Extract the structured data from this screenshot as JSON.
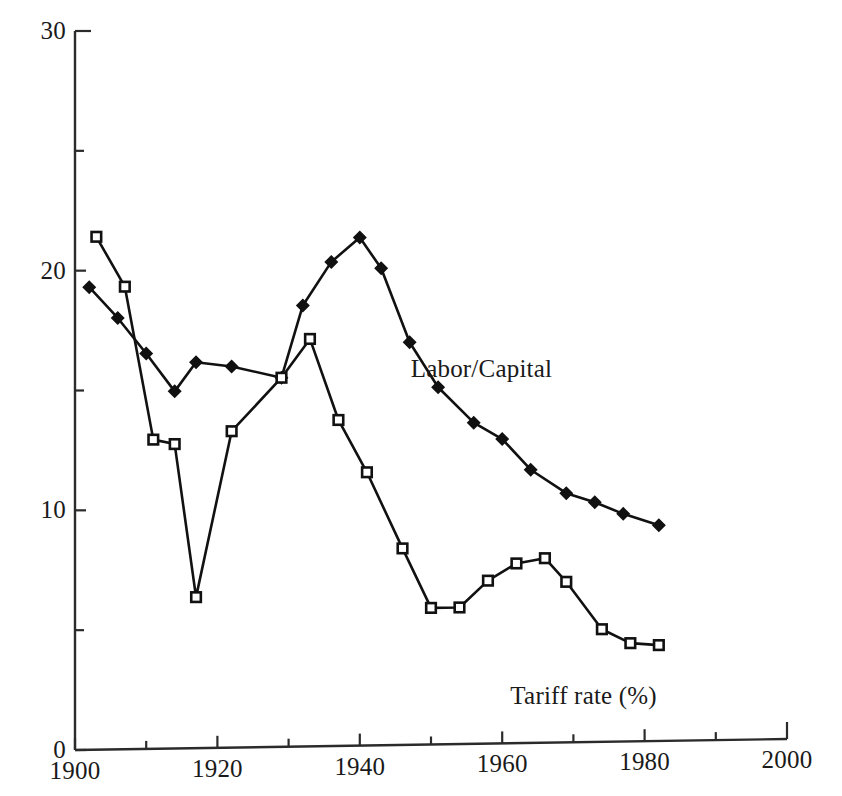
{
  "chart_data": {
    "type": "line",
    "title": "",
    "xlabel": "",
    "ylabel": "",
    "xlim": [
      1900,
      2000
    ],
    "ylim": [
      0,
      30
    ],
    "grid": false,
    "legend_position": "inline-annotation",
    "x_ticks": [
      1900,
      1920,
      1940,
      1960,
      1980,
      2000
    ],
    "x_minor_ticks": [
      1910,
      1930,
      1950,
      1970,
      1990
    ],
    "y_ticks": [
      0,
      10,
      20,
      30
    ],
    "y_minor_ticks": [
      5,
      15,
      25
    ],
    "x_tick_labels": [
      "1900",
      "1920",
      "1940",
      "1960",
      "1980",
      "2000"
    ],
    "y_tick_labels": [
      "0",
      "10",
      "20",
      "30"
    ],
    "annotations": [
      {
        "text": "Labor/Capital",
        "x": 1964,
        "y": 15.6
      },
      {
        "text": "Tariff rate (%)",
        "x": 1978,
        "y": 1.9
      }
    ],
    "series": [
      {
        "name": "Labor/Capital",
        "marker": "filled-diamond",
        "points": [
          {
            "x": 1902,
            "y": 19.3
          },
          {
            "x": 1906,
            "y": 18.0
          },
          {
            "x": 1910,
            "y": 16.5
          },
          {
            "x": 1914,
            "y": 14.9
          },
          {
            "x": 1917,
            "y": 16.1
          },
          {
            "x": 1922,
            "y": 15.9
          },
          {
            "x": 1929,
            "y": 15.4
          },
          {
            "x": 1932,
            "y": 18.4
          },
          {
            "x": 1936,
            "y": 20.2
          },
          {
            "x": 1940,
            "y": 21.2
          },
          {
            "x": 1943,
            "y": 19.9
          },
          {
            "x": 1947,
            "y": 16.8
          },
          {
            "x": 1951,
            "y": 14.9
          },
          {
            "x": 1956,
            "y": 13.4
          },
          {
            "x": 1960,
            "y": 12.7
          },
          {
            "x": 1964,
            "y": 11.4
          },
          {
            "x": 1969,
            "y": 10.4
          },
          {
            "x": 1973,
            "y": 10.0
          },
          {
            "x": 1977,
            "y": 9.5
          },
          {
            "x": 1982,
            "y": 9.0
          }
        ]
      },
      {
        "name": "Tariff rate (%)",
        "marker": "open-square",
        "points": [
          {
            "x": 1903,
            "y": 21.4
          },
          {
            "x": 1907,
            "y": 19.3
          },
          {
            "x": 1911,
            "y": 12.9
          },
          {
            "x": 1914,
            "y": 12.7
          },
          {
            "x": 1917,
            "y": 6.3
          },
          {
            "x": 1922,
            "y": 13.2
          },
          {
            "x": 1929,
            "y": 15.4
          },
          {
            "x": 1933,
            "y": 17.0
          },
          {
            "x": 1937,
            "y": 13.6
          },
          {
            "x": 1941,
            "y": 11.4
          },
          {
            "x": 1946,
            "y": 8.2
          },
          {
            "x": 1950,
            "y": 5.7
          },
          {
            "x": 1954,
            "y": 5.7
          },
          {
            "x": 1958,
            "y": 6.8
          },
          {
            "x": 1962,
            "y": 7.5
          },
          {
            "x": 1966,
            "y": 7.7
          },
          {
            "x": 1969,
            "y": 6.7
          },
          {
            "x": 1974,
            "y": 4.7
          },
          {
            "x": 1978,
            "y": 4.1
          },
          {
            "x": 1982,
            "y": 4.0
          }
        ]
      }
    ]
  }
}
